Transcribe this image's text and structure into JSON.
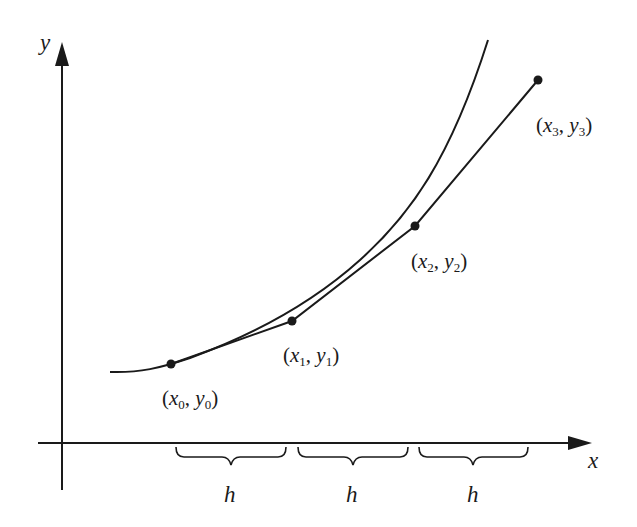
{
  "diagram": {
    "axes": {
      "x_label": "x",
      "y_label": "y"
    },
    "points": [
      {
        "id": "p0",
        "x_var": "x",
        "x_sub": "0",
        "y_var": "y",
        "y_sub": "0",
        "sep": ","
      },
      {
        "id": "p1",
        "x_var": "x",
        "x_sub": "1",
        "y_var": "y",
        "y_sub": "1",
        "sep": ","
      },
      {
        "id": "p2",
        "x_var": "x",
        "x_sub": "2",
        "y_var": "y",
        "y_sub": "2",
        "sep": ","
      },
      {
        "id": "p3",
        "x_var": "x",
        "x_sub": "3",
        "y_var": "y",
        "y_sub": "3",
        "sep": ","
      }
    ],
    "step_labels": [
      "h",
      "h",
      "h"
    ],
    "colors": {
      "ink": "#1a1a1a",
      "background": "#ffffff"
    }
  }
}
